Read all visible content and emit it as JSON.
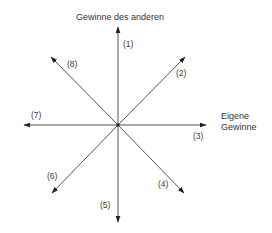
{
  "diagram": {
    "center": {
      "x": 118,
      "y": 125
    },
    "stroke_color": "#555555",
    "arrowhead_color": "#222222",
    "y_axis_title": "Gewinne des anderen",
    "x_axis_title_line1": "Eigene",
    "x_axis_title_line2": "Gewinne",
    "vectors": [
      {
        "id": 1,
        "label": "(1)",
        "tip": {
          "x": 118,
          "y": 27
        }
      },
      {
        "id": 2,
        "label": "(2)",
        "tip": {
          "x": 185,
          "y": 57
        }
      },
      {
        "id": 3,
        "label": "(3)",
        "tip": {
          "x": 206,
          "y": 125
        }
      },
      {
        "id": 4,
        "label": "(4)",
        "tip": {
          "x": 184,
          "y": 193
        }
      },
      {
        "id": 5,
        "label": "(5)",
        "tip": {
          "x": 118,
          "y": 222
        }
      },
      {
        "id": 6,
        "label": "(6)",
        "tip": {
          "x": 52,
          "y": 193
        }
      },
      {
        "id": 7,
        "label": "(7)",
        "tip": {
          "x": 24,
          "y": 125
        }
      },
      {
        "id": 8,
        "label": "(8)",
        "tip": {
          "x": 51,
          "y": 57
        }
      }
    ]
  }
}
